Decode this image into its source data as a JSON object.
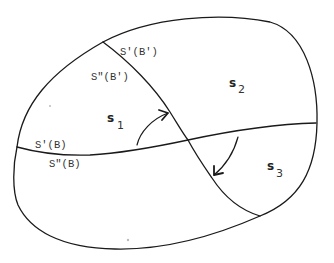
{
  "diagram": {
    "regions": [
      {
        "id": "s1",
        "letter": "s",
        "subscript": "1"
      },
      {
        "id": "s2",
        "letter": "s",
        "subscript": "2"
      },
      {
        "id": "s3",
        "letter": "s",
        "subscript": "3"
      }
    ],
    "boundary_labels": {
      "curve_b_prime_upper": "S'(B')",
      "curve_b_prime_lower": "S\"(B')",
      "curve_b_upper": "S'(B)",
      "curve_b_lower": "S\"(B)"
    },
    "colors": {
      "stroke": "#1a1a1a",
      "background": "#ffffff",
      "text": "#333333"
    }
  }
}
